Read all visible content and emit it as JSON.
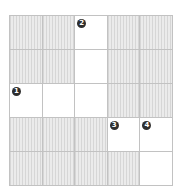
{
  "puzzle": {
    "type": "crossword",
    "rows": 5,
    "cols": 5,
    "colors": {
      "block_fill": "#e6e6e6",
      "grid_line": "#c2c2c2",
      "open_fill": "#ffffff",
      "number_badge": "#2f2f2f",
      "number_text": "#ffffff"
    },
    "cells": [
      [
        {
          "open": false
        },
        {
          "open": false
        },
        {
          "open": true,
          "number": "2"
        },
        {
          "open": false
        },
        {
          "open": false
        }
      ],
      [
        {
          "open": false
        },
        {
          "open": false
        },
        {
          "open": true
        },
        {
          "open": false
        },
        {
          "open": false
        }
      ],
      [
        {
          "open": true,
          "number": "1"
        },
        {
          "open": true
        },
        {
          "open": true
        },
        {
          "open": false
        },
        {
          "open": false
        }
      ],
      [
        {
          "open": false
        },
        {
          "open": false
        },
        {
          "open": false
        },
        {
          "open": true,
          "number": "3"
        },
        {
          "open": true,
          "number": "4"
        }
      ],
      [
        {
          "open": false
        },
        {
          "open": false
        },
        {
          "open": false
        },
        {
          "open": false
        },
        {
          "open": true
        }
      ]
    ]
  }
}
